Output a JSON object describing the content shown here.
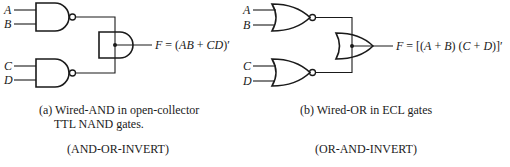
{
  "left_circuit": {
    "inputs": [
      "A",
      "B",
      "C",
      "D"
    ],
    "gate_type": "NAND",
    "wired_gate": "AND",
    "output_label": "F",
    "output_expr": "F = (AB + CD)′",
    "caption_line1": "(a) Wired-AND in open-collector",
    "caption_line2": "TTL NAND gates.",
    "function_name": "(AND-OR-INVERT)"
  },
  "right_circuit": {
    "inputs": [
      "A",
      "B",
      "C",
      "D"
    ],
    "gate_type": "NOR",
    "wired_gate": "OR",
    "output_label": "F",
    "output_expr": "F = [(A + B) (C + D)]′",
    "caption_line1": "(b) Wired-OR in ECL gates",
    "function_name": "(OR-AND-INVERT)"
  },
  "colors": {
    "ink": "#1a1a1a",
    "background": "#ffffff"
  }
}
